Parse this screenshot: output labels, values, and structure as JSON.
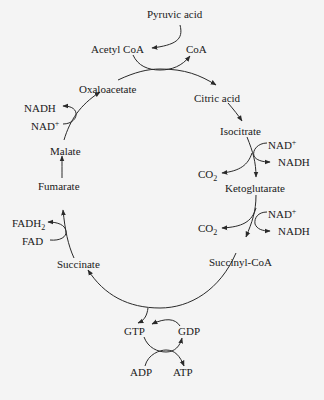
{
  "diagram": {
    "stroke_color": "#2a2a2a",
    "background": "#f4f4f4",
    "nodes": {
      "pyruvic_acid": "Pyruvic acid",
      "acetyl_coa": "Acetyl CoA",
      "coa": "CoA",
      "citric_acid": "Citric acid",
      "isocitrate": "Isocitrate",
      "ketoglutarate": "Ketoglutarate",
      "succinyl_coa": "Succinyl-CoA",
      "succinate": "Succinate",
      "fumarate": "Fumarate",
      "malate": "Malate",
      "oxaloacetate": "Oxaloacetate",
      "gtp": "GTP",
      "gdp": "GDP",
      "adp": "ADP",
      "atp": "ATP"
    },
    "cofactors": {
      "isocitrate_step": {
        "nad_plus": "NAD",
        "plus": "+",
        "nadh": "NADH",
        "co2": "CO",
        "co2_sub": "2"
      },
      "ketoglutarate_step": {
        "nad_plus": "NAD",
        "plus": "+",
        "nadh": "NADH",
        "co2": "CO",
        "co2_sub": "2"
      },
      "succinate_step": {
        "fad": "FAD",
        "fadh2": "FADH",
        "fadh2_sub": "2"
      },
      "malate_step": {
        "nad_plus": "NAD",
        "plus": "+",
        "nadh": "NADH"
      }
    },
    "edges": [
      [
        "Pyruvic acid",
        "Acetyl CoA"
      ],
      [
        "Acetyl CoA + Oxaloacetate",
        "Citric acid",
        "releases CoA"
      ],
      [
        "Citric acid",
        "Isocitrate"
      ],
      [
        "Isocitrate",
        "Ketoglutarate",
        "NAD+ → NADH, CO2"
      ],
      [
        "Ketoglutarate",
        "Succinyl-CoA",
        "NAD+ → NADH, CO2"
      ],
      [
        "Succinyl-CoA",
        "Succinate",
        "GDP → GTP; ADP → ATP"
      ],
      [
        "Succinate",
        "Fumarate",
        "FAD → FADH2"
      ],
      [
        "Fumarate",
        "Malate"
      ],
      [
        "Malate",
        "Oxaloacetate",
        "NAD+ → NADH"
      ]
    ]
  }
}
